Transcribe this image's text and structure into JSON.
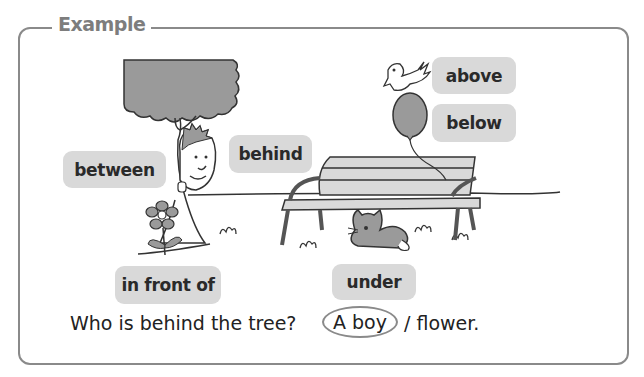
{
  "section": {
    "title": "Example"
  },
  "word_chips": [
    {
      "id": "between",
      "label": "between"
    },
    {
      "id": "behind",
      "label": "behind"
    },
    {
      "id": "above",
      "label": "above"
    },
    {
      "id": "below",
      "label": "below"
    },
    {
      "id": "in_front_of",
      "label": "in front of"
    },
    {
      "id": "under",
      "label": "under"
    }
  ],
  "question": {
    "text": "Who is behind the tree?",
    "option_a": "A boy",
    "separator_option_b": "/ flower.",
    "selected": "A boy"
  },
  "colors": {
    "frame": "#8a8a8a",
    "chip_bg": "#d9d9d9",
    "title": "#7d7d7d",
    "fill_gray": "#9a9a9a"
  }
}
